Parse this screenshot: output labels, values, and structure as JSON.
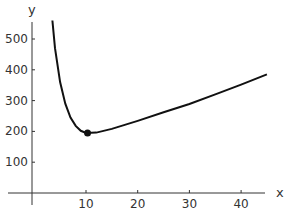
{
  "chart_data": {
    "type": "line",
    "title": "",
    "xlabel": "x",
    "ylabel": "y",
    "xlim": [
      -1,
      46
    ],
    "ylim": [
      -40,
      560
    ],
    "x_ticks": [
      10,
      20,
      30,
      40
    ],
    "y_ticks": [
      100,
      200,
      300,
      400,
      500
    ],
    "grid": false,
    "series": [
      {
        "name": "curve",
        "x": [
          3.5,
          4,
          5,
          6,
          7,
          8,
          9,
          10,
          12,
          15,
          20,
          25,
          30,
          35,
          40,
          45
        ],
        "y": [
          560,
          470,
          360,
          290,
          245,
          218,
          202,
          195,
          196,
          208,
          234,
          262,
          289,
          320,
          352,
          385
        ]
      }
    ],
    "annotations": [
      {
        "type": "point",
        "x": 10.3,
        "y": 195,
        "label": "minimum"
      }
    ]
  }
}
